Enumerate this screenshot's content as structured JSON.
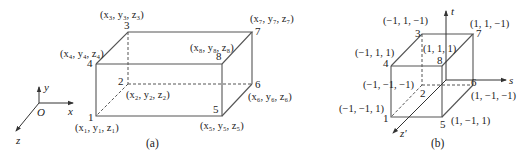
{
  "figure_a": {
    "caption": "(a)",
    "axes": {
      "origin": "O",
      "x": "x",
      "y": "y",
      "z": "z"
    },
    "vertices": [
      {
        "id": "1",
        "num": "1",
        "coord": "(x₁, y₁, z₁)"
      },
      {
        "id": "2",
        "num": "2",
        "coord": "(x₂, y₂, z₂)"
      },
      {
        "id": "3",
        "num": "3",
        "coord": "(x₃, y₃, z₃)"
      },
      {
        "id": "4",
        "num": "4",
        "coord": "(x₄, y₄, z₄)"
      },
      {
        "id": "5",
        "num": "5",
        "coord": "(x₅, y₅, z₅)"
      },
      {
        "id": "6",
        "num": "6",
        "coord": "(x₆, y₆, z₆)"
      },
      {
        "id": "7",
        "num": "7",
        "coord": "(x₇, y₇, z₇)"
      },
      {
        "id": "8",
        "num": "8",
        "coord": "(x₈, y₈, z₈)"
      }
    ]
  },
  "figure_b": {
    "caption": "(b)",
    "axes": {
      "s": "s",
      "t": "t",
      "z": "z′"
    },
    "vertices": [
      {
        "id": "1",
        "num": "1",
        "coord": "(−1, −1, 1)"
      },
      {
        "id": "2",
        "num": "2",
        "coord": "(−1, −1, −1)"
      },
      {
        "id": "3",
        "num": "3",
        "coord": "(−1, 1, −1)"
      },
      {
        "id": "4",
        "num": "4",
        "coord": "(−1, 1, 1)"
      },
      {
        "id": "5",
        "num": "5",
        "coord": "(1, −1, 1)"
      },
      {
        "id": "6",
        "num": "6",
        "coord": "(1, −1, −1)"
      },
      {
        "id": "7",
        "num": "7",
        "coord": "(1, 1, −1)"
      },
      {
        "id": "8",
        "num": "8",
        "coord": "(1, 1, 1)"
      }
    ]
  }
}
